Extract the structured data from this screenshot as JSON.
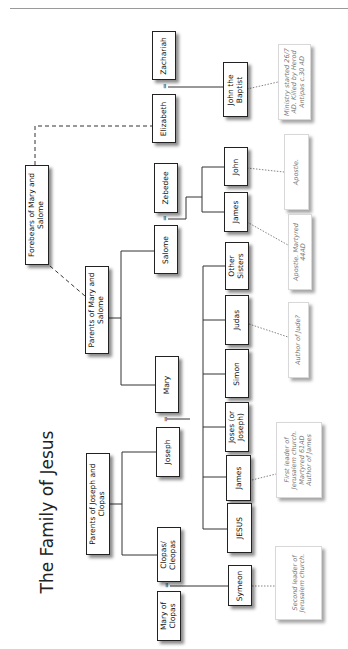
{
  "title": "The Family of Jesus",
  "people": {
    "zachariah": "Zachariah",
    "elizabeth": "Elizabeth",
    "john_baptist": "John the\nBaptist",
    "forebears": "Forebears of Mary and\nSalome",
    "zebedee": "Zebedee",
    "salome": "Salome",
    "john": "John",
    "james_apostle": "James",
    "parents_mary_salome": "Parents of Mary and\nSalome",
    "mary": "Mary",
    "other_sisters": "Other\nSisters",
    "judas": "Judas",
    "simon": "Simon",
    "joses": "Joses (or\nJoseph)",
    "james": "James",
    "jesus": "JESUS",
    "joseph": "Joseph",
    "parents_joseph_clopas": "Parents of Joseph and\nClopas",
    "clopas": "Clopas/\nCleopas",
    "mary_of_clopas": "Mary of\nClopas",
    "symeon": "Symeon"
  },
  "notes": {
    "john_baptist": "Ministry started 26/7\nAD. Killed by Herod\nAntipas c.30 AD",
    "john": "Apostle.",
    "james_apostle": "Apostle. Martyred\n44AD",
    "judas": "Author of Jude?",
    "james": "First leader of\nJerusalem church.\nMartyred 61AD\nAuthor of James",
    "symeon": "Second leader of\nJerusalem church."
  },
  "marriage_symbol": "="
}
